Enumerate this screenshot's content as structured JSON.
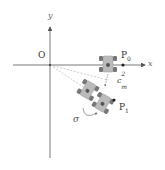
{
  "diagram": {
    "type": "robot-pose-coordinate-diagram",
    "axes": {
      "x_label": "x",
      "y_label": "y",
      "origin_label": "O"
    },
    "points": [
      {
        "id": "P0",
        "label": "P",
        "subscript": "0"
      },
      {
        "id": "P1",
        "label": "P",
        "subscript": "1"
      }
    ],
    "annotations": {
      "c_label": "c",
      "c_sub": "m",
      "c_sup": "2",
      "rotation_label": "σ"
    },
    "robots": [
      {
        "id": "robot-at-p0",
        "angle_deg": 0
      },
      {
        "id": "robot-intermediate",
        "angle_deg": 30
      },
      {
        "id": "robot-at-p1",
        "angle_deg": 30
      }
    ],
    "colors": {
      "axis": "#555555",
      "dashed": "#aaaaaa",
      "robot_body": "#bbbbbb",
      "robot_wheel": "#777777",
      "text": "#333333",
      "point": "#222222"
    }
  }
}
